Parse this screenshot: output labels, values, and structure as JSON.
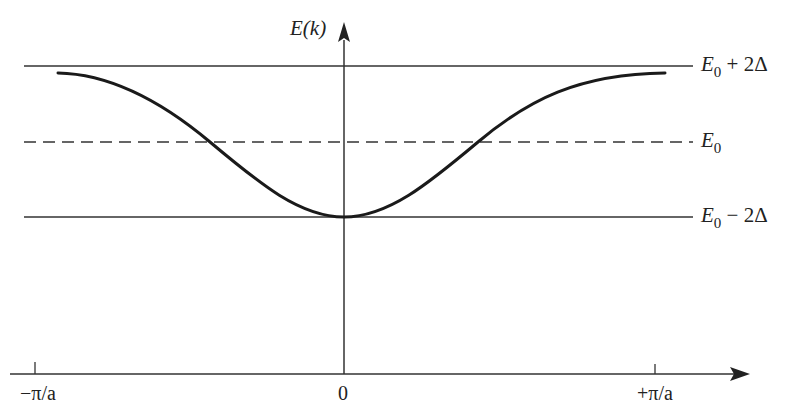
{
  "diagram": {
    "type": "band-structure",
    "y_axis_label": "E(k)",
    "x_ticks": [
      {
        "label": "−π/a",
        "position": "-pi/a"
      },
      {
        "label": "0",
        "position": "0"
      },
      {
        "label": "+π/a",
        "position": "+pi/a"
      }
    ],
    "levels": [
      {
        "name": "top",
        "symbol": "E",
        "subscript": "0",
        "suffix": " + 2Δ",
        "style": "solid"
      },
      {
        "name": "middle",
        "symbol": "E",
        "subscript": "0",
        "suffix": "",
        "style": "dashed"
      },
      {
        "name": "bottom",
        "symbol": "E",
        "subscript": "0",
        "suffix": " − 2Δ",
        "style": "solid"
      }
    ],
    "curve": {
      "description": "E(k) = E0 - 2Δ cos(ka)",
      "min_at": "k = 0, E0 − 2Δ",
      "max_at": "k = ±π/a, E0 + 2Δ"
    }
  },
  "colors": {
    "line": "#222222",
    "background": "#ffffff"
  }
}
